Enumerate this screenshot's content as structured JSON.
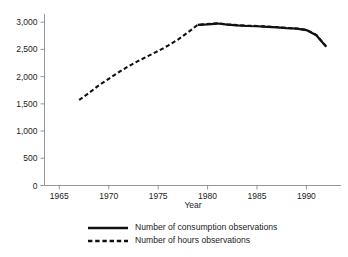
{
  "chart_data": {
    "type": "line",
    "title": "",
    "subtitle": "",
    "xlabel": "Year",
    "ylabel": "",
    "xlim": [
      1963.5,
      1993.5
    ],
    "ylim": [
      0,
      3150
    ],
    "grid": false,
    "legend_position": "bottom",
    "x_ticks": [
      "1965",
      "1970",
      "1975",
      "1980",
      "1985",
      "1990"
    ],
    "x_tick_values": [
      1965,
      1970,
      1975,
      1980,
      1985,
      1990
    ],
    "y_ticks": [
      "0",
      "500",
      "1,000",
      "1,500",
      "2,000",
      "2,500",
      "3,000"
    ],
    "y_tick_values": [
      0,
      500,
      1000,
      1500,
      2000,
      2500,
      3000
    ],
    "series": [
      {
        "name": "Number of consumption observations",
        "style": "solid",
        "color": "#111111",
        "x": [
          1979,
          1980,
          1981,
          1982,
          1983,
          1984,
          1985,
          1986,
          1987,
          1988,
          1989,
          1990,
          1991,
          1992
        ],
        "values": [
          2950,
          2960,
          2975,
          2955,
          2940,
          2930,
          2925,
          2915,
          2905,
          2890,
          2880,
          2855,
          2760,
          2550
        ]
      },
      {
        "name": "Number of hours observations",
        "style": "dashed",
        "color": "#111111",
        "x": [
          1967,
          1968,
          1969,
          1970,
          1971,
          1972,
          1973,
          1974,
          1975,
          1976,
          1977,
          1978,
          1979,
          1980,
          1981,
          1982,
          1983,
          1984,
          1985,
          1986,
          1987,
          1988,
          1989,
          1990,
          1991,
          1992
        ],
        "values": [
          1570,
          1700,
          1840,
          1960,
          2080,
          2190,
          2290,
          2380,
          2470,
          2570,
          2680,
          2810,
          2950,
          2965,
          2980,
          2960,
          2945,
          2935,
          2930,
          2920,
          2910,
          2895,
          2885,
          2860,
          2765,
          2555
        ]
      }
    ]
  },
  "legend": {
    "items": [
      {
        "label": "Number of consumption observations",
        "style": "solid"
      },
      {
        "label": "Number of hours observations",
        "style": "dashed"
      }
    ]
  }
}
